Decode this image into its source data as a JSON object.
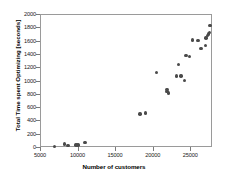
{
  "chart_data": {
    "type": "scatter",
    "title": "",
    "xlabel": "Number of customers",
    "ylabel": "Total Time spent Optimizing [seconds]",
    "xlim": [
      5000,
      27900
    ],
    "ylim": [
      0,
      2000
    ],
    "xticks": [
      5000,
      10000,
      15000,
      20000,
      25000
    ],
    "xtick_labels": [
      "5000",
      "10000",
      "15000",
      "20000",
      "25000"
    ],
    "yticks": [
      0,
      200,
      400,
      600,
      800,
      1000,
      1200,
      1400,
      1600,
      1800,
      2000
    ],
    "ytick_labels": [
      "0",
      "200",
      "400",
      "600",
      "800",
      "1000",
      "1200",
      "1400",
      "1600",
      "1800",
      "2000"
    ],
    "grid": false,
    "legend": false,
    "marker_color": "#4a4a4a",
    "marker_shape": "circle",
    "frame_color": "#9a9a9a",
    "points": [
      {
        "x": 6800,
        "y": 25
      },
      {
        "x": 8150,
        "y": 60
      },
      {
        "x": 8600,
        "y": 35
      },
      {
        "x": 9650,
        "y": 45
      },
      {
        "x": 9900,
        "y": 45
      },
      {
        "x": 10850,
        "y": 80
      },
      {
        "x": 18200,
        "y": 510
      },
      {
        "x": 18900,
        "y": 525
      },
      {
        "x": 20350,
        "y": 1135
      },
      {
        "x": 21750,
        "y": 880
      },
      {
        "x": 21800,
        "y": 850
      },
      {
        "x": 21950,
        "y": 830
      },
      {
        "x": 23050,
        "y": 1080
      },
      {
        "x": 23300,
        "y": 1260
      },
      {
        "x": 23650,
        "y": 1085
      },
      {
        "x": 24100,
        "y": 1015
      },
      {
        "x": 24300,
        "y": 1390
      },
      {
        "x": 24750,
        "y": 1380
      },
      {
        "x": 25150,
        "y": 1625
      },
      {
        "x": 25900,
        "y": 1620
      },
      {
        "x": 26300,
        "y": 1500
      },
      {
        "x": 26900,
        "y": 1545
      },
      {
        "x": 26950,
        "y": 1655
      },
      {
        "x": 27150,
        "y": 1690
      },
      {
        "x": 27300,
        "y": 1715
      },
      {
        "x": 27400,
        "y": 1740
      },
      {
        "x": 27500,
        "y": 1840
      }
    ]
  }
}
